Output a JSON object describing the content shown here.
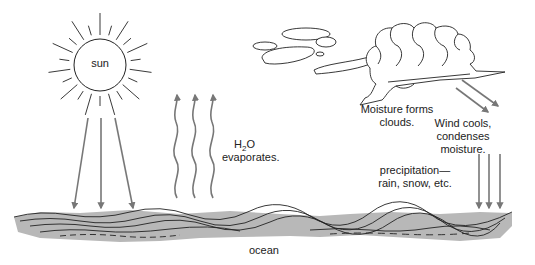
{
  "diagram": {
    "labels": {
      "sun": "sun",
      "h2o_prefix": "H",
      "h2o_subscript": "2",
      "h2o_suffix": "O",
      "evaporates": "evaporates.",
      "moisture_forms_line1": "Moisture forms",
      "moisture_forms_line2": "clouds.",
      "wind_line1": "Wind cools,",
      "wind_line2": "condenses",
      "wind_line3": "moisture.",
      "precip_line1": "precipitation—",
      "precip_line2": "rain, snow, etc.",
      "ocean": "ocean"
    },
    "colors": {
      "arrow": "#777777",
      "outline": "#222222",
      "ocean_fill": "#b8b8b8",
      "background": "#ffffff"
    },
    "elements": {
      "sun_ray_count": 22,
      "sunlight_arrow_count": 3,
      "evaporation_arrow_count": 3,
      "wind_arrow_count": 2,
      "precipitation_arrow_count": 3
    }
  }
}
